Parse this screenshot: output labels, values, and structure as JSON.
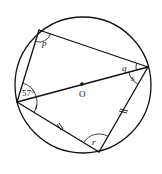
{
  "diagram": {
    "type": "circle-geometry",
    "circle": {
      "cx": 83,
      "cy": 85,
      "r": 68
    },
    "center_label": "O",
    "vertices": {
      "top_left": {
        "x": 39,
        "y": 30
      },
      "right": {
        "x": 148,
        "y": 67
      },
      "left": {
        "x": 17,
        "y": 102
      },
      "bottom": {
        "x": 99,
        "y": 152
      }
    },
    "angles": {
      "p": {
        "label": "p",
        "vertex": "top_left"
      },
      "q": {
        "label": "q",
        "vertex": "right"
      },
      "s": {
        "label": "s",
        "vertex": "right"
      },
      "given": {
        "label": "57°",
        "vertex": "left"
      },
      "t": {
        "label": "t",
        "vertex": "left"
      },
      "r": {
        "label": "r",
        "vertex": "bottom"
      }
    },
    "equal_sides": [
      "left-bottom",
      "bottom-right"
    ],
    "colors": {
      "line": "#111111",
      "background": "#ffffff"
    }
  }
}
